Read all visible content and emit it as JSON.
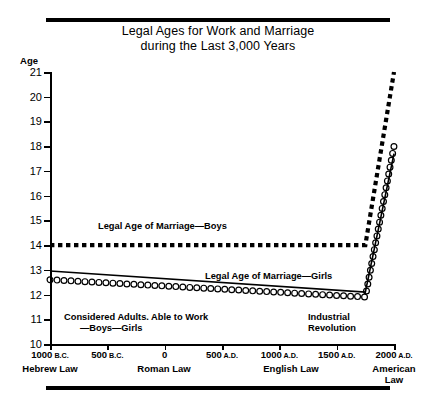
{
  "title": {
    "line1": "Legal Ages for Work and Marriage",
    "line2": "during the Last 3,000 Years"
  },
  "axis": {
    "y_title": "Age"
  },
  "annotations": {
    "marriage_boys": "Legal Age of Marriage—Boys",
    "marriage_girls": "Legal Age of Marriage—Girls",
    "adults_line1": "Considered Adults. Able to Work",
    "adults_line2": "—Boys—Girls",
    "industrial_line1": "Industrial",
    "industrial_line2": "Revolution"
  },
  "law_labels": [
    {
      "text": "Hebrew Law",
      "x": 50
    },
    {
      "text": "Roman Law",
      "x": 164
    },
    {
      "text": "English Law",
      "x": 291
    },
    {
      "text": "American\nLaw",
      "x": 394
    }
  ],
  "chart_data": {
    "type": "line",
    "title": "Legal Ages for Work and Marriage during the Last 3,000 Years",
    "xlabel": "",
    "ylabel": "Age",
    "xlim": [
      -1000,
      2000
    ],
    "ylim": [
      10,
      21
    ],
    "yticks": [
      10,
      11,
      12,
      13,
      14,
      15,
      16,
      17,
      18,
      19,
      20,
      21
    ],
    "ytick_labels": [
      "10",
      "11",
      "12",
      "13",
      "14",
      "15",
      "16",
      "17",
      "18",
      "19",
      "20",
      "21"
    ],
    "xticks": [
      -1000,
      -500,
      0,
      500,
      1000,
      1500,
      2000
    ],
    "xtick_labels": [
      "1000 B.C.",
      "500 B.C.",
      "0",
      "500 A.D.",
      "1000 A.D.",
      "1500 A.D.",
      "2000 A.D."
    ],
    "xtick_numbers": [
      "1000",
      "500",
      "0",
      "500",
      "1000",
      "1500",
      "2000"
    ],
    "xtick_eras": [
      "B.C.",
      "B.C.",
      "",
      "A.D.",
      "A.D.",
      "A.D.",
      "A.D."
    ],
    "grid": false,
    "legend": "inline-annotations",
    "series": [
      {
        "name": "Legal Age of Marriage—Boys",
        "style": "dotted-thick",
        "x": [
          -1000,
          1750,
          2000
        ],
        "y": [
          14.0,
          14.0,
          21.0
        ]
      },
      {
        "name": "Considered Adults. Able to Work—Boys",
        "style": "solid-thin",
        "x": [
          -1000,
          1750,
          2000
        ],
        "y": [
          12.95,
          12.1,
          17.7
        ]
      },
      {
        "name": "Legal Age of Marriage—Girls / Able to Work—Girls",
        "style": "open-circles",
        "x": [
          -1000,
          1750,
          2000
        ],
        "y": [
          12.6,
          11.9,
          18.0
        ]
      }
    ],
    "event_markers": [
      {
        "label": "Industrial Revolution",
        "x": 1750
      }
    ]
  }
}
